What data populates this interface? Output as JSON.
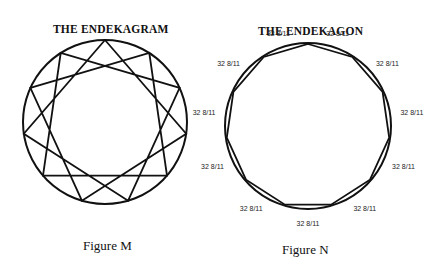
{
  "figure_m": {
    "title": "THE ENDEKAGRAM",
    "caption": "Figure M",
    "center": [
      105,
      122
    ],
    "radius": 82,
    "points": 11,
    "step": 3
  },
  "figure_n": {
    "title": "THE ENDEKAGON",
    "caption": "Figure N",
    "center": [
      308,
      126
    ],
    "radius": 83,
    "sides": 11,
    "angle_label": "32 8/11",
    "labels": [
      "32 8/11",
      "32 8/11",
      "32 8/11",
      "32 8/11",
      "32 8/11",
      "32 8/11",
      "32 8/11",
      "32 8/11",
      "32 8/11",
      "32 8/11",
      "32 8/11"
    ]
  },
  "colors": {
    "stroke": "#111111",
    "background": "#ffffff"
  }
}
